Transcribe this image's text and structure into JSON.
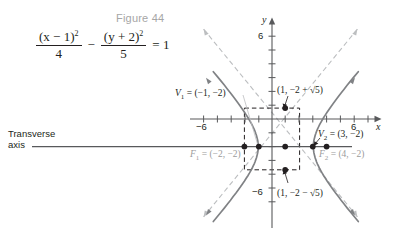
{
  "figure": {
    "title": "Figure 44",
    "equation": {
      "num1": "(x − 1)",
      "den1": "4",
      "minus": "−",
      "num2": "(y + 2)",
      "den2": "5",
      "equals": "= 1",
      "exp": "2",
      "plain": "(x − 1)^2/4 − (y + 2)^2/5 = 1"
    }
  },
  "axes": {
    "x_label": "x",
    "y_label": "y",
    "x_tick_neg": "−6",
    "x_tick_pos": "6",
    "y_tick_pos": "6",
    "y_tick_neg": "−6",
    "x_range": [
      -8,
      8
    ],
    "y_range": [
      -8,
      8
    ],
    "unit_px": 13.8,
    "origin_px": [
      272,
      119
    ]
  },
  "annotations": {
    "transverse_line1": "Transverse",
    "transverse_line2": "axis",
    "vertex1": "V",
    "vertex1_sub": "1",
    "vertex1_coord": " = (−1, −2)",
    "vertex2": "V",
    "vertex2_sub": "2",
    "vertex2_coord": " = (3, −2)",
    "focus1": "F",
    "focus1_sub": "1",
    "focus1_coord": " = (−2, −2)",
    "focus2": "F",
    "focus2_sub": "2",
    "focus2_coord": " = (4, −2)",
    "point_top": "(1, −2 + √5)",
    "point_bottom": "(1, −2 − √5)"
  },
  "chart_data": {
    "type": "line",
    "title": "Figure 44",
    "xlabel": "x",
    "ylabel": "y",
    "xlim": [
      -8,
      8
    ],
    "ylim": [
      -8,
      8
    ],
    "grid": false,
    "curve": "hyperbola",
    "equation": "(x − 1)^2/4 − (y + 2)^2/5 = 1",
    "center": [
      1,
      -2
    ],
    "a": 2,
    "b": 2.2360679,
    "c": 3,
    "vertices": [
      [
        -1,
        -2
      ],
      [
        3,
        -2
      ]
    ],
    "foci": [
      [
        -2,
        -2
      ],
      [
        4,
        -2
      ]
    ],
    "conjugate_points": [
      [
        1,
        0.2360679
      ],
      [
        1,
        -4.2360679
      ]
    ],
    "asymptote_slopes": [
      1.118034,
      -1.118034
    ],
    "transverse_axis": "horizontal, y = -2",
    "colors": {
      "curve": "#808285",
      "asymptote": "#bcbec0",
      "box": "#231f20",
      "axis": "#58595b",
      "title": "#a6a6a6",
      "gray_label": "#9b9b9b"
    }
  }
}
